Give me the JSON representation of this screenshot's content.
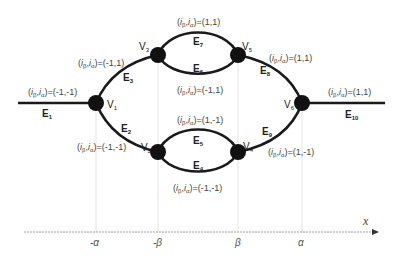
{
  "colors": {
    "edge": "#1a1a1a",
    "node": "#111111",
    "guide": "#d9d9d9",
    "axis": "#9a9a9a",
    "text": "#444444"
  },
  "vertices": [
    {
      "id": "V1",
      "name": "V",
      "sub": "1",
      "x": 96,
      "y": 103
    },
    {
      "id": "V2",
      "name": "V",
      "sub": "2",
      "x": 158,
      "y": 152
    },
    {
      "id": "V3",
      "name": "V",
      "sub": "3",
      "x": 158,
      "y": 55
    },
    {
      "id": "V4",
      "name": "V",
      "sub": "4",
      "x": 238,
      "y": 152
    },
    {
      "id": "V5",
      "name": "V",
      "sub": "5",
      "x": 238,
      "y": 55
    },
    {
      "id": "V6",
      "name": "V",
      "sub": "6",
      "x": 302,
      "y": 103
    }
  ],
  "edges": [
    {
      "name": "E",
      "sub": "1"
    },
    {
      "name": "E",
      "sub": "2"
    },
    {
      "name": "E",
      "sub": "3"
    },
    {
      "name": "E",
      "sub": "4"
    },
    {
      "name": "E",
      "sub": "5"
    },
    {
      "name": "E",
      "sub": "6"
    },
    {
      "name": "E",
      "sub": "7"
    },
    {
      "name": "E",
      "sub": "8"
    },
    {
      "name": "E",
      "sub": "9"
    },
    {
      "name": "E",
      "sub": "10"
    }
  ],
  "state_labels": {
    "prefix_i": "i",
    "sub_beta": "β",
    "sub_alpha": "α",
    "E1": "=(-1,-1)",
    "E3": "=(-1,1)",
    "E2": "=(-1,-1)",
    "E7": "=(1,1)",
    "E6": "=(-1,1)",
    "E5": "=(1,-1)",
    "E4": "=(-1,-1)",
    "E8": "=(1,1)",
    "E9": "=(1,-1)",
    "E10": "=(1,1)"
  },
  "axis": {
    "name": "x",
    "ticks": [
      "-α",
      "-β",
      "β",
      "α"
    ]
  }
}
